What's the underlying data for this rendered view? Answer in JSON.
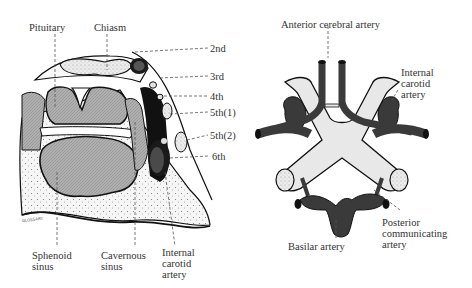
{
  "left_panel": {
    "name": "Coronal section through cavernous sinus",
    "labels": {
      "pituitary": "Pituitary",
      "chiasm": "Chiasm",
      "n2": "2nd",
      "n3": "3rd",
      "n4": "4th",
      "n5_1": "5th(1)",
      "n5_2": "5th(2)",
      "n6": "6th",
      "sphenoid_1": "Sphenoid",
      "sphenoid_2": "sinus",
      "cavernous_1": "Cavernous",
      "cavernous_2": "sinus",
      "ica_1": "Internal",
      "ica_2": "carotid",
      "ica_3": "artery"
    }
  },
  "right_panel": {
    "name": "Circle of Willis with chiasm",
    "labels": {
      "aca": "Anterior cerebral artery",
      "ica_1": "Internal",
      "ica_2": "carotid",
      "ica_3": "artery",
      "basilar": "Basilar artery",
      "pcom_1": "Posterior",
      "pcom_2": "communicating",
      "pcom_3": "artery"
    }
  },
  "colors": {
    "artery": "#3a3a3a",
    "gland": "#a8a8a8",
    "light_fill": "#e8e8e8",
    "bone": "#f4f4f4",
    "line": "#111111",
    "leader": "#555555"
  }
}
